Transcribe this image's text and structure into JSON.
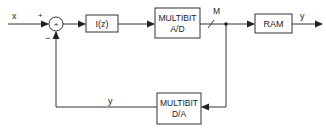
{
  "diagram": {
    "input_label": "x",
    "plus_sign": "+",
    "minus_sign": "−",
    "summer_symbol": "+",
    "integrator": "I(z)",
    "adc": {
      "line1": "MULTIBIT",
      "line2": "A/D"
    },
    "bus_width_label": "M",
    "ram": "RAM",
    "output_label": "y",
    "dac": {
      "line1": "MULTIBIT",
      "line2": "D/A"
    },
    "feedback_label": "y"
  }
}
